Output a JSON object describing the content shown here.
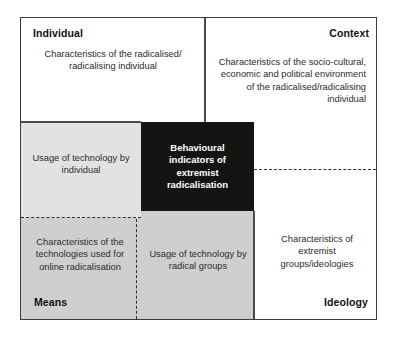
{
  "diagram": {
    "quadrants": {
      "individual": {
        "label": "Individual",
        "body": "Characteristics of the radicalised/ radicalising individual"
      },
      "context": {
        "label": "Context",
        "body": "Characteristics of the socio-cultural, economic and political environment of the radicalised/radicalising individual"
      },
      "means": {
        "label": "Means",
        "body": "Characteristics of the technologies used for online radicalisation"
      },
      "ideology": {
        "label": "Ideology",
        "body": "Characteristics of extremist groups/ideologies"
      }
    },
    "overlap_cells": {
      "usage_by_individual": "Usage of technology by individual",
      "usage_by_radical_groups": "Usage of technology by radical groups"
    },
    "center": {
      "text": "Behavioural indicators of extremist radicalisation"
    },
    "colors": {
      "center_fill": "#141414",
      "center_text": "#ffffff",
      "shaded_light": "#e2e2e2",
      "shaded_dark": "#cfcfcf",
      "border": "#3a3a3a",
      "background": "#ffffff"
    }
  }
}
